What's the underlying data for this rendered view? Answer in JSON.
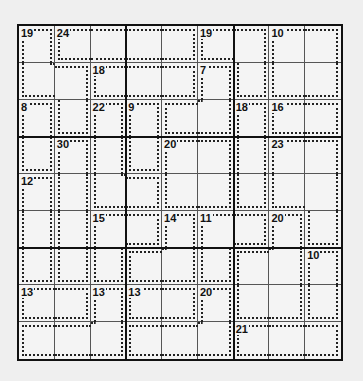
{
  "puzzle": {
    "type": "killer-sudoku",
    "size": 9,
    "cages": [
      {
        "sum": "19",
        "cells": [
          [
            0,
            0
          ],
          [
            1,
            0
          ],
          [
            1,
            1
          ],
          [
            2,
            1
          ]
        ]
      },
      {
        "sum": "24",
        "cells": [
          [
            0,
            1
          ],
          [
            0,
            2
          ],
          [
            0,
            3
          ],
          [
            0,
            4
          ]
        ]
      },
      {
        "sum": "19",
        "cells": [
          [
            0,
            5
          ],
          [
            0,
            6
          ],
          [
            1,
            6
          ]
        ]
      },
      {
        "sum": "10",
        "cells": [
          [
            0,
            7
          ],
          [
            0,
            8
          ],
          [
            1,
            7
          ],
          [
            1,
            8
          ]
        ]
      },
      {
        "sum": "18",
        "cells": [
          [
            1,
            2
          ],
          [
            1,
            3
          ],
          [
            1,
            4
          ]
        ]
      },
      {
        "sum": "7",
        "cells": [
          [
            1,
            5
          ],
          [
            2,
            5
          ],
          [
            2,
            4
          ]
        ]
      },
      {
        "sum": "8",
        "cells": [
          [
            2,
            0
          ],
          [
            3,
            0
          ]
        ]
      },
      {
        "sum": "22",
        "cells": [
          [
            2,
            2
          ],
          [
            3,
            2
          ],
          [
            4,
            2
          ],
          [
            4,
            3
          ]
        ]
      },
      {
        "sum": "9",
        "cells": [
          [
            2,
            3
          ],
          [
            3,
            3
          ]
        ]
      },
      {
        "sum": "18",
        "cells": [
          [
            2,
            6
          ],
          [
            3,
            6
          ],
          [
            4,
            6
          ]
        ]
      },
      {
        "sum": "16",
        "cells": [
          [
            2,
            7
          ],
          [
            2,
            8
          ]
        ]
      },
      {
        "sum": "30",
        "cells": [
          [
            3,
            1
          ],
          [
            4,
            1
          ],
          [
            5,
            1
          ],
          [
            6,
            1
          ]
        ]
      },
      {
        "sum": "20",
        "cells": [
          [
            3,
            4
          ],
          [
            3,
            5
          ],
          [
            4,
            4
          ],
          [
            4,
            5
          ]
        ]
      },
      {
        "sum": "23",
        "cells": [
          [
            3,
            7
          ],
          [
            3,
            8
          ],
          [
            4,
            7
          ],
          [
            4,
            8
          ],
          [
            5,
            8
          ]
        ]
      },
      {
        "sum": "12",
        "cells": [
          [
            4,
            0
          ],
          [
            5,
            0
          ],
          [
            6,
            0
          ]
        ]
      },
      {
        "sum": "15",
        "cells": [
          [
            5,
            2
          ],
          [
            5,
            3
          ],
          [
            6,
            2
          ]
        ]
      },
      {
        "sum": "14",
        "cells": [
          [
            5,
            4
          ],
          [
            6,
            3
          ],
          [
            6,
            4
          ]
        ]
      },
      {
        "sum": "11",
        "cells": [
          [
            5,
            5
          ],
          [
            5,
            6
          ],
          [
            6,
            5
          ]
        ]
      },
      {
        "sum": "20",
        "cells": [
          [
            5,
            7
          ],
          [
            6,
            6
          ],
          [
            6,
            7
          ],
          [
            7,
            6
          ],
          [
            7,
            7
          ]
        ]
      },
      {
        "sum": "10",
        "cells": [
          [
            6,
            8
          ],
          [
            7,
            8
          ]
        ]
      },
      {
        "sum": "13",
        "cells": [
          [
            7,
            0
          ],
          [
            7,
            1
          ]
        ]
      },
      {
        "sum": "13",
        "cells": [
          [
            7,
            2
          ],
          [
            8,
            0
          ],
          [
            8,
            1
          ],
          [
            8,
            2
          ]
        ]
      },
      {
        "sum": "13",
        "cells": [
          [
            7,
            3
          ],
          [
            7,
            4
          ]
        ]
      },
      {
        "sum": "20",
        "cells": [
          [
            7,
            5
          ],
          [
            8,
            3
          ],
          [
            8,
            4
          ],
          [
            8,
            5
          ]
        ]
      },
      {
        "sum": "21",
        "cells": [
          [
            8,
            6
          ],
          [
            8,
            7
          ],
          [
            8,
            8
          ]
        ]
      }
    ],
    "values": []
  }
}
